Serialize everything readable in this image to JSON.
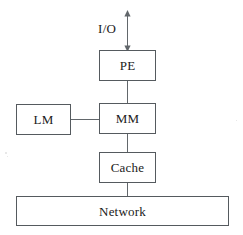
{
  "diagram": {
    "background_color": "#ffffff",
    "stroke_color": "#555a5e",
    "text_color": "#1b1b1b",
    "nodes": [
      {
        "id": "io",
        "label": "I/O",
        "shape": "label"
      },
      {
        "id": "pe",
        "label": "PE",
        "shape": "rectangle"
      },
      {
        "id": "lm",
        "label": "LM",
        "shape": "rectangle"
      },
      {
        "id": "mm",
        "label": "MM",
        "shape": "rectangle"
      },
      {
        "id": "cache",
        "label": "Cache",
        "shape": "rectangle"
      },
      {
        "id": "network",
        "label": "Network",
        "shape": "rectangle-wide"
      }
    ],
    "edges": [
      {
        "from": "io",
        "to": "pe",
        "arrow": "both",
        "orientation": "vertical"
      },
      {
        "from": "pe",
        "to": "mm",
        "arrow": "none",
        "orientation": "vertical"
      },
      {
        "from": "lm",
        "to": "mm",
        "arrow": "none",
        "orientation": "horizontal"
      },
      {
        "from": "mm",
        "to": "cache",
        "arrow": "none",
        "orientation": "vertical"
      },
      {
        "from": "cache",
        "to": "network",
        "arrow": "none",
        "orientation": "vertical"
      }
    ]
  }
}
